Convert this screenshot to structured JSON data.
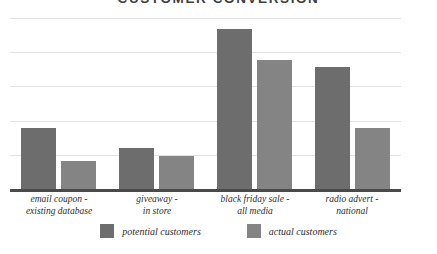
{
  "chart_data": {
    "type": "bar",
    "title": "CUSTOMER CONVERSION",
    "xlabel": "",
    "ylabel": "",
    "ylim": [
      0,
      6
    ],
    "grid": true,
    "gridline_count": 6,
    "legend_position": "bottom",
    "categories": [
      "email coupon -\nexisting database",
      "giveaway -\nin store",
      "black friday sale -\nall media",
      "radio advert -\nnational"
    ],
    "category_lines": [
      [
        "email coupon -",
        "existing database"
      ],
      [
        "giveaway -",
        "in store"
      ],
      [
        "black friday sale -",
        "all media"
      ],
      [
        "radio advert -",
        "national"
      ]
    ],
    "series": [
      {
        "name": "potential customers",
        "color": "#6d6d6d",
        "values": [
          2.15,
          1.45,
          5.6,
          4.3
        ]
      },
      {
        "name": "actual customers",
        "color": "#848484",
        "values": [
          1.0,
          1.18,
          4.55,
          2.15
        ]
      }
    ]
  },
  "legend": {
    "items": [
      {
        "label": "potential customers",
        "color": "#6d6d6d"
      },
      {
        "label": "actual customers",
        "color": "#848484"
      }
    ]
  },
  "colors": {
    "potential": "#6d6d6d",
    "actual": "#848484",
    "gridline": "#e2e2e2",
    "axis": "#4a4a4a",
    "text": "#2e2e2e",
    "title": "#3f3f3f",
    "background": "#ffffff"
  }
}
